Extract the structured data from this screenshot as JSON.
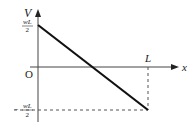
{
  "diagram": {
    "type": "shear-force-diagram",
    "axes": {
      "y_label": "V",
      "x_label": "x",
      "origin_label": "O"
    },
    "labels": {
      "top_value_numerator": "wL",
      "top_value_denominator": "2",
      "bottom_value_sign": "−",
      "bottom_value_numerator": "wL",
      "bottom_value_denominator": "2",
      "length_label": "L"
    },
    "line": {
      "start": {
        "x": 0,
        "V": "wL/2"
      },
      "end": {
        "x": "L",
        "V": "-wL/2"
      }
    },
    "colors": {
      "line": "#111111",
      "axis": "#444444",
      "dashed": "#555555"
    }
  }
}
